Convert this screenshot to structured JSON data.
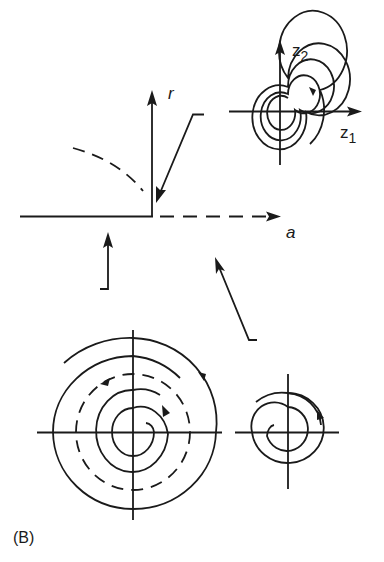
{
  "figure": {
    "panel_label": "(B)",
    "bifurcation_plot": {
      "horizontal_axis_label": "a",
      "vertical_axis_label": "r",
      "description": "Subcritical Hopf bifurcation diagram: stable branch r=0 for a<0 (solid), unstable r=0 for a>0 (dashed), unstable limit cycle branch (dashed arc)"
    },
    "phase_portraits": [
      {
        "id": "top-right",
        "x_axis_label_base": "z",
        "x_axis_label_sub": "1",
        "y_axis_label_base": "z",
        "y_axis_label_sub": "2",
        "description": "Tightly wound spiral flowing outward (a > 0)"
      },
      {
        "id": "bottom-left",
        "description": "Stable focus inside unstable limit cycle (dashed), trajectories outside spiral outward"
      },
      {
        "id": "bottom-right",
        "description": "Spiral phase portrait"
      }
    ],
    "colors": {
      "ink": "#1a1a1a",
      "background": "#ffffff"
    }
  }
}
